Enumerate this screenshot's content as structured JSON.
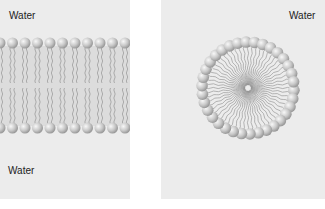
{
  "figure": {
    "left_panel": {
      "title": "Lipid bilayer",
      "top_label": "Water",
      "bottom_label": "Water"
    },
    "right_panel": {
      "title": "Micelle",
      "top_label": "Water"
    },
    "colors": {
      "background": "#ececec",
      "head": "#c8c8c8",
      "tail": "#8a8a8a",
      "text": "#222222"
    }
  }
}
